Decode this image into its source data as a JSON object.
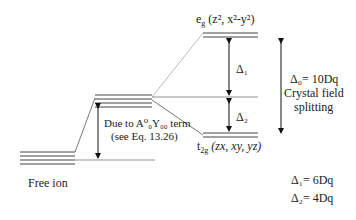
{
  "diagram": {
    "levels": {
      "free_ion": {
        "label": "Free ion",
        "lines": 4
      },
      "shifted": {
        "lines": 4
      },
      "eg": {
        "name": "e",
        "sub": "g",
        "orbitals": "(z², x²-y²)",
        "lines": 3
      },
      "t2g": {
        "name": "t",
        "sub": "2g",
        "orbitals": "(zx, xy, yz)",
        "lines": 3
      }
    },
    "shift_annotation": {
      "line1": "Due to A⁰₀Y₀₀ term",
      "line2": "(see Eq. 13.26)"
    },
    "delta1_label": "Δ₁",
    "delta2_label": "Δ₂",
    "delta0": {
      "line1": "Δ₀= 10Dq",
      "line2": "Crystal field",
      "line3": "splitting"
    },
    "equations": {
      "delta1": "Δ₁= 6Dq",
      "delta2": "Δ₂= 4Dq"
    }
  }
}
